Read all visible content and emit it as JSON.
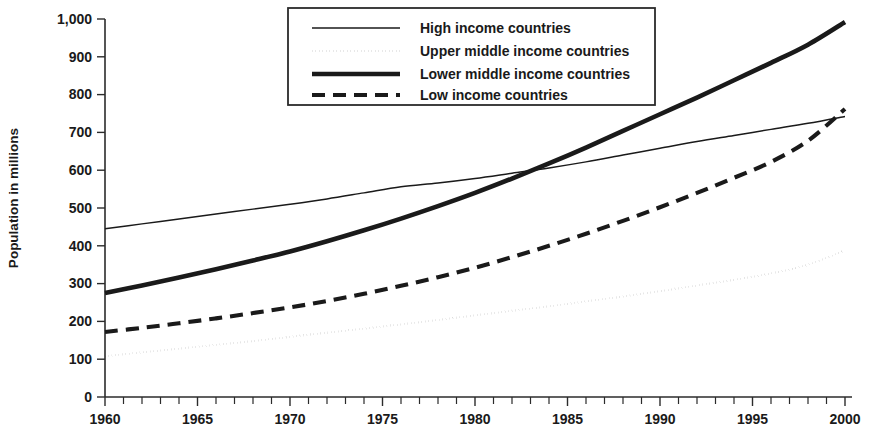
{
  "chart_data": {
    "type": "line",
    "title": "",
    "subtitle": "",
    "xlabel": "",
    "ylabel": "Population in millions",
    "xlim": [
      1960,
      2000
    ],
    "ylim": [
      0,
      1000
    ],
    "grid": false,
    "legend_position": "top-center",
    "x_tick_labels": [
      "1960",
      "1965",
      "1970",
      "1975",
      "1980",
      "1985",
      "1990",
      "1995",
      "2000"
    ],
    "x_tick_values": [
      1960,
      1965,
      1970,
      1975,
      1980,
      1985,
      1990,
      1995,
      2000
    ],
    "x_minor_tick_step": 1,
    "y_tick_labels": [
      "0",
      "100",
      "200",
      "300",
      "400",
      "500",
      "600",
      "700",
      "800",
      "900",
      "1,000"
    ],
    "y_tick_values": [
      0,
      100,
      200,
      300,
      400,
      500,
      600,
      700,
      800,
      900,
      1000
    ],
    "x": [
      1960,
      1962,
      1964,
      1966,
      1968,
      1970,
      1972,
      1974,
      1976,
      1978,
      1980,
      1982,
      1984,
      1986,
      1988,
      1990,
      1992,
      1994,
      1996,
      1998,
      2000
    ],
    "series": [
      {
        "name": "High income countries",
        "style": "solid-thin",
        "color": "#1a1a1a",
        "values": [
          445,
          458,
          471,
          484,
          497,
          510,
          524,
          540,
          556,
          566,
          578,
          592,
          606,
          622,
          640,
          658,
          676,
          692,
          708,
          724,
          742
        ]
      },
      {
        "name": "Upper middle income countries",
        "style": "dotted",
        "color": "#1a1a1a",
        "values": [
          108,
          118,
          128,
          138,
          148,
          159,
          170,
          181,
          192,
          204,
          216,
          228,
          240,
          253,
          266,
          280,
          295,
          310,
          327,
          350,
          388
        ]
      },
      {
        "name": "Lower middle income countries",
        "style": "solid-thick",
        "color": "#1a1a1a",
        "values": [
          275,
          295,
          316,
          338,
          361,
          385,
          412,
          441,
          472,
          505,
          540,
          578,
          618,
          660,
          704,
          748,
          792,
          838,
          884,
          932,
          992
        ]
      },
      {
        "name": "Low income countries",
        "style": "dashed",
        "color": "#1a1a1a",
        "values": [
          172,
          183,
          195,
          208,
          222,
          237,
          254,
          273,
          294,
          317,
          342,
          370,
          400,
          432,
          466,
          502,
          540,
          580,
          622,
          678,
          762
        ]
      }
    ],
    "annotations": [
      {
        "text": "High income and Lower middle income series cross near 1985",
        "x": 1985.5,
        "y": 635
      },
      {
        "text": "Low income series crosses High income near 1999",
        "x": 1999,
        "y": 735
      }
    ]
  },
  "legend": {
    "items": [
      {
        "label": "High income countries",
        "swatch": "solid-thin-swatch"
      },
      {
        "label": "Upper middle income countries",
        "swatch": "dotted-swatch"
      },
      {
        "label": "Lower middle income countries",
        "swatch": "solid-thick-swatch"
      },
      {
        "label": "Low income countries",
        "swatch": "dashed-swatch"
      }
    ]
  }
}
